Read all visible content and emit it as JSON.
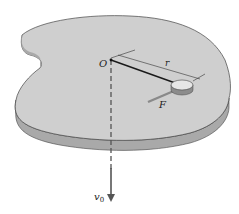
{
  "diagram": {
    "labels": {
      "origin": "O",
      "radius": "r",
      "force": "F",
      "velocity": "v",
      "velocity_subscript": "0"
    },
    "colors": {
      "table_top": "#cfcfcf",
      "table_edge": "#a9a9a9",
      "outline": "#444444",
      "string": "#1a1a1a",
      "puck_top": "#e6e6e6",
      "puck_side": "#8c8c8c",
      "force_arrow": "#8a8a8a",
      "velocity_arrow": "#555555"
    }
  }
}
